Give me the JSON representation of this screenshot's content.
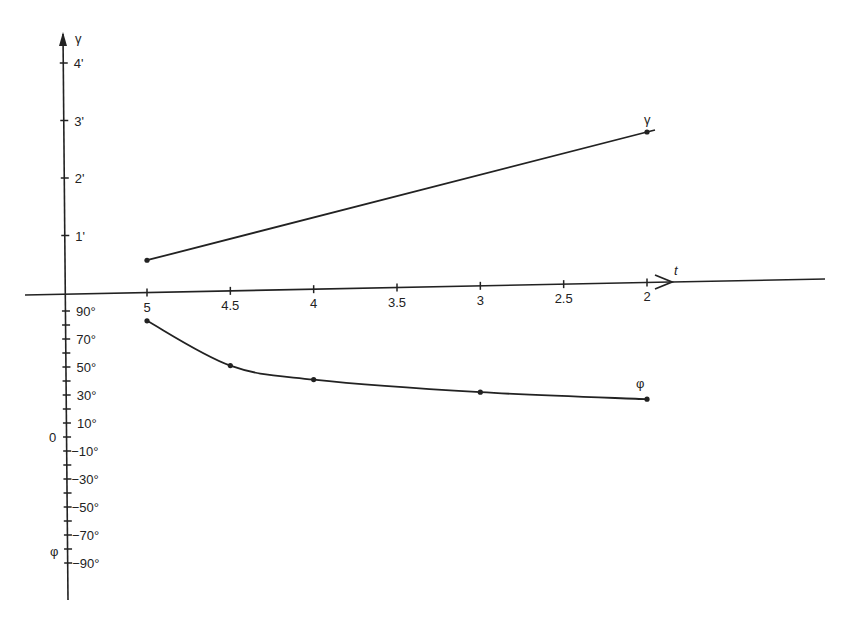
{
  "chart_data": {
    "type": "line",
    "title": "",
    "xlabel": "t",
    "x_axis_direction": "decreasing left-to-right",
    "x_ticks": [
      "5",
      "4.5",
      "4",
      "3.5",
      "3",
      "2.5",
      "2"
    ],
    "upper_axis": {
      "label": "γ",
      "ticks": [
        "1'",
        "2'",
        "3'",
        "4'"
      ],
      "unit": "arcminutes",
      "ylim": [
        0,
        4.3
      ]
    },
    "lower_axis": {
      "label": "φ",
      "zero_label": "0",
      "ticks": [
        "90°",
        "70°",
        "50°",
        "30°",
        "10°",
        "−10°",
        "−30°",
        "−50°",
        "−70°",
        "−90°"
      ],
      "unit": "degrees",
      "ylim": [
        -100,
        100
      ]
    },
    "series": [
      {
        "name": "γ",
        "x": [
          5,
          2
        ],
        "values": [
          0.57,
          2.8
        ]
      },
      {
        "name": "φ",
        "x": [
          5,
          4.5,
          4,
          3,
          2
        ],
        "values": [
          83,
          51,
          41,
          32,
          27
        ]
      }
    ],
    "grid": false,
    "legend": "inline labels at series ends"
  },
  "labels": {
    "gamma_axis": "γ",
    "phi_axis": "φ",
    "t_axis": "t",
    "zero": "0",
    "gamma_series": "γ",
    "phi_series": "φ"
  }
}
